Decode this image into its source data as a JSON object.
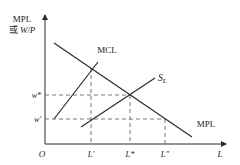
{
  "diagram": {
    "type": "labor-market-monopsony",
    "y_axis_label_line1": "MPL",
    "y_axis_label_prefix": "或 ",
    "y_axis_label_var": "W/P",
    "x_axis_label": "L",
    "origin_label": "O",
    "y_ticks": [
      {
        "label": "w*",
        "y": 95
      },
      {
        "label": "w'",
        "y": 119
      }
    ],
    "x_ticks": [
      {
        "label": "L'",
        "x": 91
      },
      {
        "label": "L*",
        "x": 130
      },
      {
        "label": "L''",
        "x": 165
      }
    ],
    "curves": [
      {
        "name": "MCL",
        "label": "MCL",
        "from": [
          54,
          119
        ],
        "to": [
          98,
          62
        ]
      },
      {
        "name": "SL",
        "label_main": "S",
        "label_sub": "L",
        "from": [
          81,
          127
        ],
        "to": [
          155,
          78
        ]
      },
      {
        "name": "MPL",
        "label": "MPL",
        "from": [
          54,
          43
        ],
        "to": [
          192,
          137
        ]
      }
    ],
    "colors": {
      "line": "#2b2b2b",
      "dashed": "#555555",
      "text": "#222222"
    }
  }
}
